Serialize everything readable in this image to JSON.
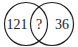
{
  "diagram": {
    "type": "venn",
    "left_circle": {
      "value": "121"
    },
    "intersection": {
      "value": "?"
    },
    "right_circle": {
      "value": "36"
    },
    "stroke_color": "#222222",
    "background": "#ffffff"
  }
}
